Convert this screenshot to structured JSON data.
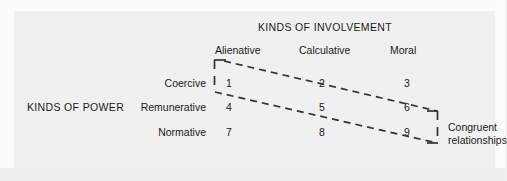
{
  "figure": {
    "column_group_title": "KINDS OF INVOLVEMENT",
    "row_group_title": "KINDS OF POWER",
    "column_headers": [
      "Alienative",
      "Calculative",
      "Moral"
    ],
    "row_headers": [
      "Coercive",
      "Remunerative",
      "Normative"
    ],
    "cells": [
      [
        "1",
        "2",
        "3"
      ],
      [
        "4",
        "5",
        "6"
      ],
      [
        "7",
        "8",
        "9"
      ]
    ],
    "annotation": {
      "line1": "Congruent",
      "line2": "relationships"
    },
    "colors": {
      "background": "#f0f2f2",
      "paper": "#fbfbfb",
      "text": "#1a1a1a",
      "dash": "#333333"
    }
  }
}
